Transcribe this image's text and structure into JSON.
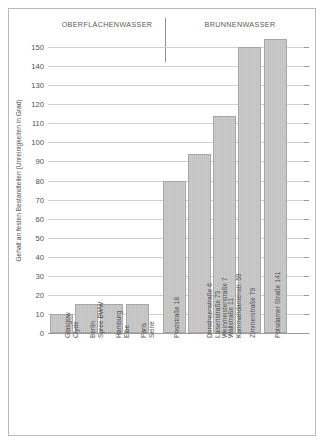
{
  "figure": {
    "background": "#ffffff",
    "frame_color": "#b9b9b9",
    "bar_fill": "#c8c8c8",
    "bar_border": "#a6a6a6",
    "grid_color": "#cfcfcf"
  },
  "headers": {
    "left": "OBERFLÄCHENWASSER",
    "right": "BRUNNENWASSER"
  },
  "chart_data": {
    "type": "bar",
    "title": "",
    "xlabel": "",
    "ylabel": "Gehalt an festen Bestandteilen (Unreinigkeiten in Grad)",
    "ylim": [
      0,
      160
    ],
    "ytick_step": 10,
    "yticks": [
      0,
      10,
      20,
      30,
      40,
      50,
      60,
      70,
      80,
      90,
      100,
      110,
      120,
      130,
      140,
      150
    ],
    "ytick_labels": [
      "0",
      "10",
      "20",
      "30",
      "40",
      "50",
      "60",
      "70",
      "80",
      "90",
      "100",
      "110",
      "120",
      "130",
      "140",
      "150"
    ],
    "grid": true,
    "legend": "none",
    "groups": [
      {
        "name": "OBERFLÄCHENWASSER",
        "categories": [
          "Glasgow Clyde",
          "Berlin Spree BWW",
          "Hamburg Elbe",
          "Paris Seine"
        ],
        "values": [
          10,
          15,
          15,
          15
        ]
      },
      {
        "name": "BRUNNENWASSER",
        "categories": [
          "Poststraße 18",
          "Dorotheenstraße 6 Luisenstraße 73 Weinmeisterstraße 7",
          "Wallstraße 11 Kommandantenstr. 59",
          "Zimmerstraße 79",
          "Potsdamer Straße 141"
        ],
        "values": [
          80,
          94,
          114,
          150,
          154
        ]
      }
    ],
    "categories": [
      "Glasgow Clyde",
      "Berlin Spree BWW",
      "Hamburg Elbe",
      "Paris Seine",
      "Poststraße 18",
      "Dorotheenstraße 6 Luisenstraße 73 Weinmeisterstraße 7",
      "Wallstraße 11 Kommandantenstr. 59",
      "Zimmerstraße 79",
      "Potsdamer Straße 141"
    ],
    "values": [
      10,
      15,
      15,
      15,
      80,
      94,
      114,
      150,
      154
    ]
  },
  "bars": [
    {
      "id": "glasgow-clyde",
      "value": 10,
      "lines": [
        "Glasgow",
        "Clyde"
      ]
    },
    {
      "id": "berlin-spree-bww",
      "value": 15,
      "lines": [
        "Berlin",
        "Spree BWW"
      ]
    },
    {
      "id": "hamburg-elbe",
      "value": 15,
      "lines": [
        "Hamburg",
        "Elbe"
      ]
    },
    {
      "id": "paris-seine",
      "value": 15,
      "lines": [
        "Paris",
        "Seine"
      ]
    },
    {
      "id": "poststrasse-18",
      "value": 80,
      "lines": [
        "Poststraße 18"
      ]
    },
    {
      "id": "dorotheenstrasse-6",
      "value": 94,
      "lines": [
        "Dorotheenstraße 6",
        "Luisenstraße 73",
        "Weinmeisterstraße 7"
      ]
    },
    {
      "id": "wallstrasse-11",
      "value": 114,
      "lines": [
        "Wallstraße 11",
        "Kommandantenstr. 59"
      ]
    },
    {
      "id": "zimmerstrasse-79",
      "value": 150,
      "lines": [
        "Zimmerstraße 79"
      ]
    },
    {
      "id": "potsdamer-strasse-141",
      "value": 154,
      "lines": [
        "Potsdamer Straße 141"
      ]
    }
  ]
}
